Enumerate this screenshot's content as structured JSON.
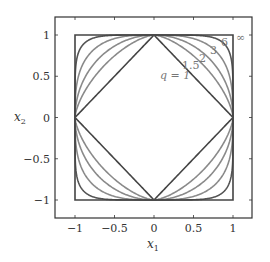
{
  "chart_data": {
    "type": "line",
    "title": "",
    "xlabel": "x1",
    "ylabel": "x2",
    "xlim": [
      -1.2,
      1.2
    ],
    "ylim": [
      -1.2,
      1.2
    ],
    "xticks": [
      -1,
      -0.5,
      0,
      0.5,
      1
    ],
    "yticks": [
      -1,
      -0.5,
      0,
      0.5,
      1
    ],
    "xtick_labels": [
      "−1",
      "−0.5",
      "0",
      "0.5",
      "1"
    ],
    "ytick_labels": [
      "−1",
      "−0.5",
      "0",
      "0.5",
      "1"
    ],
    "grid": false,
    "legend": "inline labels near upper-right",
    "series": [
      {
        "name": "q = 1",
        "q": 1,
        "label": "q = 1",
        "color": "#444444"
      },
      {
        "name": "1.5",
        "q": 1.5,
        "label": "1.5",
        "color": "#8a8a8a"
      },
      {
        "name": "2",
        "q": 2,
        "label": "2",
        "color": "#8a8a8a"
      },
      {
        "name": "3",
        "q": 3,
        "label": "3",
        "color": "#8a8a8a"
      },
      {
        "name": "6",
        "q": 6,
        "label": "6",
        "color": "#555555"
      },
      {
        "name": "∞",
        "q": "inf",
        "label": "∞",
        "color": "#444444"
      }
    ]
  },
  "axes": {
    "xlabel_base": "x",
    "xlabel_sub": "1",
    "ylabel_base": "x",
    "ylabel_sub": "2"
  },
  "labels": {
    "q1": "q = 1",
    "q15": "1.5",
    "q2": "2",
    "q3": "3",
    "q6": "6",
    "qinf": "∞"
  }
}
